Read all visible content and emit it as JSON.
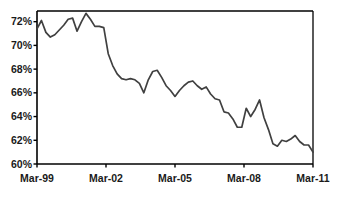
{
  "chart_data": {
    "type": "line",
    "title": "",
    "subtitle": "",
    "xlabel": "",
    "ylabel": "",
    "grid": false,
    "legend": "none",
    "series_name": "rate",
    "line_color": "#404040",
    "axis_color": "#000000",
    "background": "#ffffff",
    "xlim": [
      "Mar-99",
      "Mar-11"
    ],
    "ylim": [
      60,
      72.9
    ],
    "ytick_labels": [
      "72%",
      "70%",
      "68%",
      "66%",
      "64%",
      "62%",
      "60%"
    ],
    "ytick_values": [
      72,
      70,
      68,
      66,
      64,
      62,
      60
    ],
    "xtick_labels": [
      "Mar-99",
      "Mar-02",
      "Mar-05",
      "Mar-08",
      "Mar-11"
    ],
    "xtick_values": [
      1999.17,
      2002.17,
      2005.17,
      2008.17,
      2011.17
    ],
    "x": [
      1999.17,
      1999.42,
      1999.67,
      1999.92,
      2000.17,
      2000.42,
      2000.67,
      2000.92,
      2001.17,
      2001.42,
      2001.67,
      2001.92,
      2002.17,
      2002.42,
      2002.67,
      2002.92,
      2003.17,
      2003.42,
      2003.67,
      2003.92,
      2004.17,
      2004.42,
      2004.67,
      2004.92,
      2005.17,
      2005.42,
      2005.67,
      2005.92,
      2006.17,
      2006.42,
      2006.67,
      2006.92,
      2007.17,
      2007.42,
      2007.67,
      2007.92,
      2008.17,
      2008.42,
      2008.67,
      2008.92,
      2009.17,
      2009.42,
      2009.67,
      2009.92,
      2010.17,
      2010.42,
      2010.67,
      2010.92,
      2011.17
    ],
    "values": [
      71.4,
      72.1,
      71.1,
      70.7,
      70.9,
      71.3,
      71.7,
      72.2,
      72.3,
      71.2,
      72.0,
      72.7,
      72.2,
      71.6,
      71.6,
      71.5,
      69.3,
      68.3,
      67.6,
      67.2,
      67.1,
      67.2,
      67.1,
      66.8,
      66.0,
      67.1,
      67.8,
      67.9,
      67.3,
      66.6,
      66.2,
      65.7,
      66.2,
      66.6,
      66.9,
      67.0,
      66.6,
      66.3,
      66.5,
      65.9,
      65.5,
      65.4,
      64.4,
      64.3,
      63.8,
      63.1,
      63.1,
      64.7,
      64.0
    ],
    "values_tail": [
      64.0,
      64.6,
      65.4,
      63.9,
      62.9,
      61.7,
      61.5,
      62.0,
      61.9,
      62.1,
      62.4,
      61.9,
      61.6,
      61.6,
      61.0
    ],
    "annotations": []
  }
}
